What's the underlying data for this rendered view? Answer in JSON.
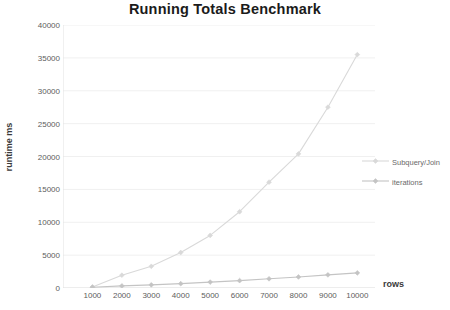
{
  "chart_data": {
    "type": "line",
    "title": "Running Totals Benchmark",
    "xlabel": "rows",
    "ylabel": "runtime ms",
    "x": [
      1000,
      2000,
      3000,
      4000,
      5000,
      6000,
      7000,
      8000,
      9000,
      10000
    ],
    "xticklabels": [
      "1000",
      "2000",
      "3000",
      "4000",
      "5000",
      "6000",
      "7000",
      "8000",
      "9000",
      "10000"
    ],
    "yticks": [
      0,
      5000,
      10000,
      15000,
      20000,
      25000,
      30000,
      35000,
      40000
    ],
    "yticklabels": [
      "0",
      "5000",
      "10000",
      "15000",
      "20000",
      "25000",
      "30000",
      "35000",
      "40000"
    ],
    "xlim": [
      0,
      10600
    ],
    "ylim": [
      0,
      40000
    ],
    "grid": "horizontal",
    "legend_position": "right",
    "series": [
      {
        "name": "Subquery/Join",
        "color": "#d9d9d9",
        "marker": "diamond",
        "values": [
          150,
          1950,
          3300,
          5400,
          8000,
          11600,
          16100,
          20400,
          27500,
          35500
        ]
      },
      {
        "name": "iterations",
        "color": "#c4c4c4",
        "marker": "diamond",
        "values": [
          120,
          320,
          480,
          660,
          900,
          1120,
          1400,
          1680,
          2000,
          2300
        ]
      }
    ]
  },
  "legend": {
    "subquery_label": "Subquery/Join",
    "iterations_label": "iterations"
  },
  "colors": {
    "title": "#1b1b1b",
    "tick": "#5d5d5d",
    "grid": "#f0f0f0",
    "axis": "#e2e2e2",
    "series_subquery": "#d9d9d9",
    "series_iterations": "#c4c4c4",
    "background": "#ffffff"
  }
}
